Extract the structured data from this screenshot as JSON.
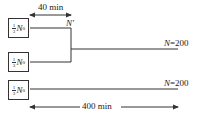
{
  "diagram": {
    "boxes": [
      {
        "fraction_num": "1",
        "fraction_den": "3",
        "variable": "N",
        "subscript": "0"
      },
      {
        "fraction_num": "1",
        "fraction_den": "3",
        "variable": "N",
        "subscript": "0"
      },
      {
        "fraction_num": "1",
        "fraction_den": "3",
        "variable": "N",
        "subscript": "0"
      }
    ],
    "junction_label": "N′",
    "top_arrow": {
      "label": "40 min"
    },
    "bottom_arrow": {
      "label": "400 min"
    },
    "outputs": [
      {
        "var": "N",
        "value": "=200"
      },
      {
        "var": "N",
        "value": "=200"
      }
    ],
    "colors": {
      "line": "#333333",
      "background": "#ffffff"
    }
  }
}
